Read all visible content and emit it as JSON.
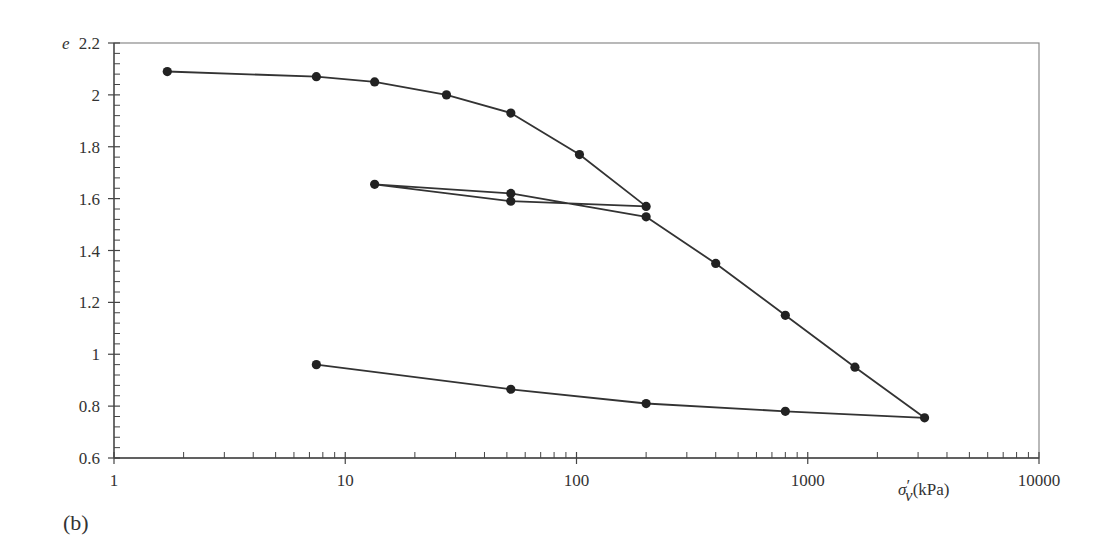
{
  "chart_data": {
    "type": "line",
    "title": "",
    "panel_label": "(b)",
    "xlabel": "σ′v (kPa)",
    "xlabel_parts": {
      "symbol": "σ",
      "prime": "′",
      "subscript": "v",
      "unit": "(kPa)"
    },
    "ylabel": "e",
    "xscale": "log",
    "xlim": [
      1,
      10000
    ],
    "ylim": [
      0.6,
      2.2
    ],
    "x_ticks": [
      "1",
      "10",
      "100",
      "1000",
      "10000"
    ],
    "y_ticks": [
      "0.6",
      "0.8",
      "1",
      "1.2",
      "1.4",
      "1.6",
      "1.8",
      "2",
      "2.2"
    ],
    "grid": false,
    "legend": null,
    "series": [
      {
        "name": "oedometer path",
        "points": [
          {
            "x": 1.7,
            "y": 2.09
          },
          {
            "x": 7.5,
            "y": 2.07
          },
          {
            "x": 13.4,
            "y": 2.05
          },
          {
            "x": 27.4,
            "y": 2.0
          },
          {
            "x": 52,
            "y": 1.93
          },
          {
            "x": 103,
            "y": 1.77
          },
          {
            "x": 200,
            "y": 1.57
          },
          {
            "x": 52,
            "y": 1.59
          },
          {
            "x": 13.4,
            "y": 1.655
          },
          {
            "x": 52,
            "y": 1.62
          },
          {
            "x": 200,
            "y": 1.53
          },
          {
            "x": 400,
            "y": 1.35
          },
          {
            "x": 800,
            "y": 1.15
          },
          {
            "x": 1600,
            "y": 0.95
          },
          {
            "x": 3200,
            "y": 0.755
          },
          {
            "x": 800,
            "y": 0.78
          },
          {
            "x": 200,
            "y": 0.81
          },
          {
            "x": 52,
            "y": 0.865
          },
          {
            "x": 7.5,
            "y": 0.96
          }
        ]
      }
    ],
    "colors": {
      "line": "#333333",
      "marker": "#222222",
      "frame": "#8a8a8a",
      "axis": "#444444"
    }
  }
}
